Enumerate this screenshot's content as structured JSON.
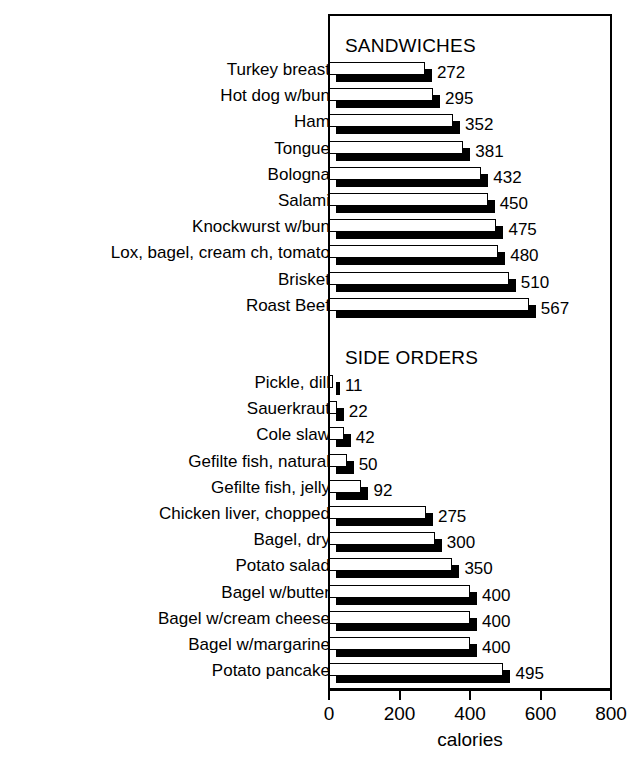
{
  "chart_data": {
    "type": "bar",
    "orientation": "horizontal",
    "title": "",
    "xlabel": "calories",
    "ylabel": "",
    "xlim": [
      0,
      800
    ],
    "xticks": [
      0,
      200,
      400,
      600,
      800
    ],
    "xtick_labels": [
      "0",
      "200",
      "400",
      "600",
      "800"
    ],
    "grid": false,
    "legend": false,
    "sections": [
      {
        "name": "SANDWICHES",
        "categories": [
          "Turkey breast",
          "Hot dog w/bun",
          "Ham",
          "Tongue",
          "Bologna",
          "Salami",
          "Knockwurst w/bun",
          "Lox, bagel, cream ch, tomato",
          "Brisket",
          "Roast Beef"
        ],
        "values": [
          272,
          295,
          352,
          381,
          432,
          450,
          475,
          480,
          510,
          567
        ],
        "value_labels": [
          "272",
          "295",
          "352",
          "381",
          "432",
          "450",
          "475",
          "480",
          "510",
          "567"
        ]
      },
      {
        "name": "SIDE ORDERS",
        "categories": [
          "Pickle, dill",
          "Sauerkraut",
          "Cole slaw",
          "Gefilte fish, natural",
          "Gefilte fish, jelly",
          "Chicken liver, chopped",
          "Bagel, dry",
          "Potato salad",
          "Bagel w/butter",
          "Bagel w/cream cheese",
          "Bagel w/margarine",
          "Potato pancake"
        ],
        "values": [
          11,
          22,
          42,
          50,
          92,
          275,
          300,
          350,
          400,
          400,
          400,
          495
        ],
        "value_labels": [
          "11",
          "22",
          "42",
          "50",
          "92",
          "275",
          "300",
          "350",
          "400",
          "400",
          "400",
          "495"
        ]
      }
    ],
    "colors": {
      "bar_face": "#ffffff",
      "bar_edge": "#000000",
      "bar_shadow": "#000000",
      "axis": "#000000",
      "background": "#ffffff"
    }
  }
}
